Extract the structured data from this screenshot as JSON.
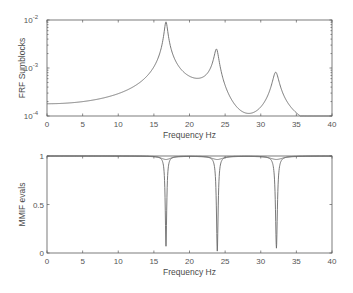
{
  "chart_data": [
    {
      "type": "line",
      "title": "",
      "xlabel": "Frequency Hz",
      "ylabel": "FRF Sumblocks",
      "yscale": "log",
      "xlim": [
        0,
        40
      ],
      "ylim": [
        0.0001,
        0.01
      ],
      "xticks": [
        0,
        5,
        10,
        15,
        20,
        25,
        30,
        35,
        40
      ],
      "yticks": [
        {
          "value": 0.0001,
          "label_base": "10",
          "label_exp": "-4"
        },
        {
          "value": 0.001,
          "label_base": "10",
          "label_exp": "-3"
        },
        {
          "value": 0.01,
          "label_base": "10",
          "label_exp": "-2"
        }
      ],
      "grid": false,
      "modes": [
        {
          "freq": 16.7,
          "peak": 0.01
        },
        {
          "freq": 23.8,
          "peak": 0.0054
        },
        {
          "freq": 32.1,
          "peak": 0.0023
        }
      ],
      "series": [
        {
          "name": "FRF Sumblocks",
          "x": [
            0,
            5,
            10,
            13,
            15,
            16,
            16.7,
            17.5,
            19,
            20,
            21,
            22.5,
            23.8,
            25,
            26.5,
            28.5,
            30,
            31.3,
            32.1,
            33,
            35,
            37.5,
            40
          ],
          "y": [
            0.00018,
            0.000195,
            0.00025,
            0.00036,
            0.00065,
            0.0015,
            0.01,
            0.0018,
            0.00055,
            0.00047,
            0.00055,
            0.0011,
            0.0054,
            0.0011,
            0.00048,
            0.00034,
            0.00047,
            0.0009,
            0.0023,
            0.0009,
            0.00033,
            0.00017,
            0.0001
          ]
        }
      ]
    },
    {
      "type": "line",
      "title": "",
      "xlabel": "Frequency Hz",
      "ylabel": "MMIF evals",
      "xlim": [
        0,
        40
      ],
      "ylim": [
        0,
        1
      ],
      "xticks": [
        0,
        5,
        10,
        15,
        20,
        25,
        30,
        35,
        40
      ],
      "yticks": [
        {
          "value": 0,
          "label": "0"
        },
        {
          "value": 0.5,
          "label": "0.5"
        },
        {
          "value": 1,
          "label": "1"
        }
      ],
      "grid": false,
      "series": [
        {
          "name": "MMIF evals",
          "dips": [
            {
              "freq": 16.7,
              "min": 0.07,
              "width": 0.35
            },
            {
              "freq": 23.9,
              "min": 0.02,
              "width": 0.4
            },
            {
              "freq": 32.2,
              "min": 0.05,
              "width": 0.45
            }
          ],
          "baseline": 1.0
        }
      ]
    }
  ]
}
